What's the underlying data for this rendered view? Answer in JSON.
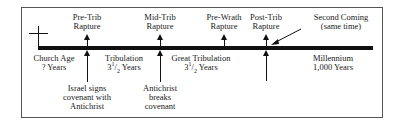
{
  "diagram": {
    "type": "timeline",
    "rapture_markers": [
      {
        "id": "pre-trib",
        "line1": "Pre-Trib",
        "line2": "Rapture"
      },
      {
        "id": "mid-trib",
        "line1": "Mid-Trib",
        "line2": "Rapture"
      },
      {
        "id": "pre-wrath",
        "line1": "Pre-Wrath",
        "line2": "Rapture"
      },
      {
        "id": "post-trib",
        "line1": "Post-Trib",
        "line2": "Rapture"
      }
    ],
    "second_coming": {
      "line1": "Second Coming",
      "line2": "(same time)"
    },
    "periods": [
      {
        "id": "church-age",
        "line1": "Church Age",
        "line2": "? Years"
      },
      {
        "id": "tribulation",
        "line1": "Tribulation",
        "years_whole": "3",
        "years_num": "1",
        "years_den": "2",
        "years_unit": "Years"
      },
      {
        "id": "great-tribulation",
        "line1": "Great Tribulation",
        "years_whole": "3",
        "years_num": "1",
        "years_den": "2",
        "years_unit": "Years"
      },
      {
        "id": "millennium",
        "line1": "Millennium",
        "line2": "1,000 Years"
      }
    ],
    "events": [
      {
        "id": "israel-covenant",
        "line1": "Israel signs",
        "line2": "covenant with",
        "line3": "Antichrist"
      },
      {
        "id": "antichrist-breaks",
        "line1": "Antichrist",
        "line2": "breaks",
        "line3": "covenant"
      }
    ],
    "colors": {
      "ink": "#111111",
      "frame": "#555555",
      "background": "#ffffff"
    }
  }
}
